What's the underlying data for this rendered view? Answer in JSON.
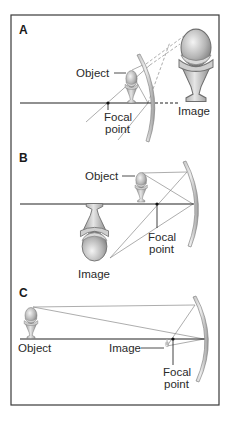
{
  "figure": {
    "panels": [
      {
        "id": "A",
        "label": "A",
        "case": "Object between focal point and mirror — virtual, upright, enlarged image behind mirror",
        "labels": {
          "object": "Object",
          "focal_line1": "Focal",
          "focal_line2": "point",
          "image": "Image"
        }
      },
      {
        "id": "B",
        "label": "B",
        "case": "Object between focal point and center of curvature — real, inverted, enlarged image",
        "labels": {
          "object": "Object",
          "focal_line1": "Focal",
          "focal_line2": "point",
          "image": "Image"
        }
      },
      {
        "id": "C",
        "label": "C",
        "case": "Object far beyond center of curvature — real, inverted, reduced image near focal point",
        "labels": {
          "object": "Object",
          "image": "Image",
          "focal_line1": "Focal",
          "focal_line2": "point"
        }
      }
    ],
    "colors": {
      "frame": "#3a3a3a",
      "axis": "#222222",
      "ray": "#8a8a8a",
      "mirror_fill": "#d8d8d8",
      "mirror_edge": "#7a7a7a",
      "sundae_scoop": "#b8b8b8",
      "sundae_cup": "#c8c8c8"
    }
  }
}
